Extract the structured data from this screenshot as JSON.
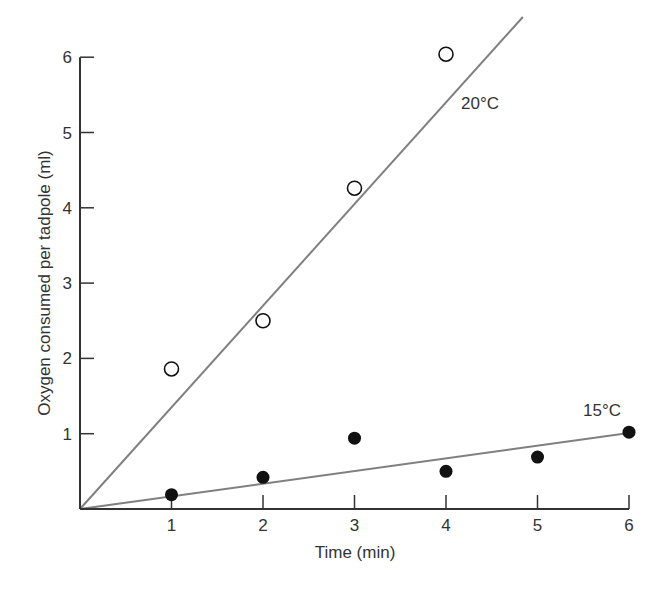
{
  "chart_data": {
    "type": "scatter",
    "title": "",
    "xlabel": "Time (min)",
    "ylabel": "Oxygen consumed per tadpole (ml)",
    "xlim": [
      0,
      6
    ],
    "ylim": [
      0,
      6
    ],
    "x_ticks": [
      1,
      2,
      3,
      4,
      5,
      6
    ],
    "y_ticks": [
      1,
      2,
      3,
      4,
      5,
      6
    ],
    "grid": false,
    "legend": "inline labels near lines",
    "series": [
      {
        "name": "20°C",
        "marker": "open-circle",
        "x": [
          1,
          2,
          3,
          4
        ],
        "y": [
          1.86,
          2.5,
          4.26,
          6.04
        ],
        "fit_line": {
          "slope": 1.35,
          "intercept": 0,
          "x_end": 4.84
        }
      },
      {
        "name": "15°C",
        "marker": "filled-circle",
        "x": [
          1,
          2,
          3,
          4,
          5,
          6
        ],
        "y": [
          0.19,
          0.42,
          0.94,
          0.5,
          0.69,
          1.02
        ],
        "fit_line": {
          "slope": 0.168,
          "intercept": 0,
          "x_end": 6
        }
      }
    ],
    "annotations": [
      {
        "text": "20°C",
        "near_series": "20°C"
      },
      {
        "text": "15°C",
        "near_series": "15°C"
      }
    ]
  },
  "colors": {
    "axis": "#333333",
    "line": "#808080",
    "marker": "#111111"
  }
}
